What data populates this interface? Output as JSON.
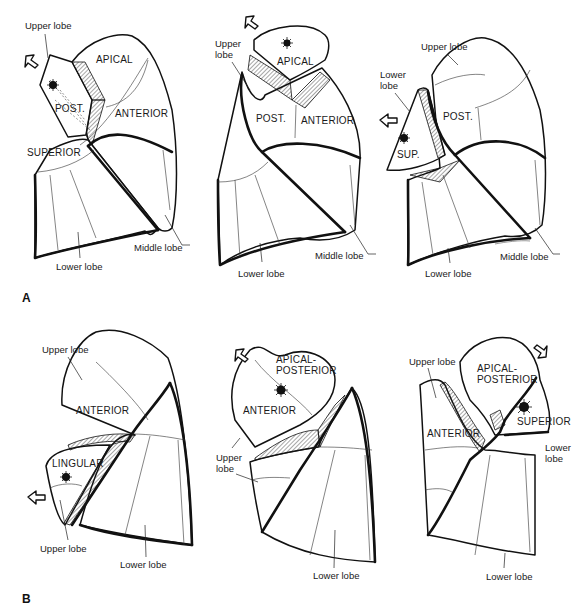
{
  "figure": {
    "panel_labels": [
      "A",
      "B"
    ],
    "colors": {
      "ink": "#111111",
      "background": "#ffffff"
    }
  },
  "panel_a": {
    "drawings": [
      {
        "id": "a1",
        "segment_labels": {
          "apical": "APICAL",
          "post": "POST.",
          "anterior": "ANTERIOR",
          "superior": "SUPERIOR"
        },
        "callouts": {
          "upper_lobe": "Upper lobe",
          "middle_lobe": "Middle lobe",
          "lower_lobe": "Lower lobe"
        }
      },
      {
        "id": "a2",
        "segment_labels": {
          "apical": "APICAL",
          "post": "POST.",
          "anterior": "ANTERIOR"
        },
        "callouts": {
          "upper_lobe": "Upper\nlobe",
          "upper_lobe_line1": "Upper",
          "upper_lobe_line2": "lobe",
          "middle_lobe": "Middle lobe",
          "lower_lobe": "Lower lobe"
        }
      },
      {
        "id": "a3",
        "segment_labels": {
          "post": "POST.",
          "sup": "SUP."
        },
        "callouts": {
          "upper_lobe": "Upper lobe",
          "lower_lobe_line1": "Lower",
          "lower_lobe_line2": "lobe",
          "middle_lobe": "Middle lobe",
          "lower_lobe": "Lower lobe"
        }
      }
    ]
  },
  "panel_b": {
    "drawings": [
      {
        "id": "b1",
        "segment_labels": {
          "anterior": "ANTERIOR",
          "lingular": "LINGULAR"
        },
        "callouts": {
          "upper_lobe_top": "Upper lobe",
          "upper_lobe_bottom": "Upper lobe",
          "lower_lobe": "Lower lobe"
        }
      },
      {
        "id": "b2",
        "segment_labels": {
          "apical_posterior_line1": "APICAL-",
          "apical_posterior_line2": "POSTERIOR",
          "anterior": "ANTERIOR"
        },
        "callouts": {
          "upper_lobe_line1": "Upper",
          "upper_lobe_line2": "lobe",
          "lower_lobe": "Lower lobe"
        }
      },
      {
        "id": "b3",
        "segment_labels": {
          "apical_posterior_line1": "APICAL-",
          "apical_posterior_line2": "POSTERIOR",
          "anterior": "ANTERIOR",
          "superior": "SUPERIOR"
        },
        "callouts": {
          "upper_lobe": "Upper lobe",
          "lower_lobe_side_line1": "Lower",
          "lower_lobe_side_line2": "lobe",
          "lower_lobe": "Lower lobe"
        }
      }
    ]
  }
}
